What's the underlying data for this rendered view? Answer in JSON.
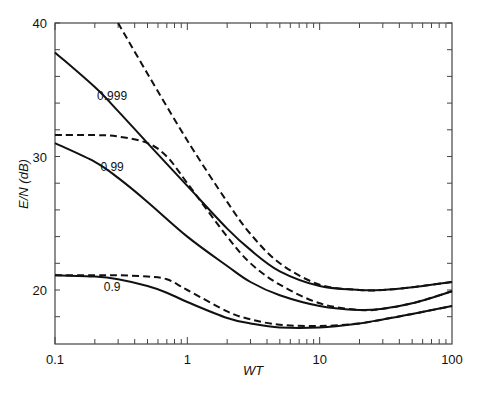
{
  "chart_data": {
    "type": "line",
    "title": "",
    "xlabel": "WT",
    "ylabel": "E/N (dB)",
    "xscale": "log",
    "xlim": [
      0.1,
      100
    ],
    "ylim": [
      16,
      40
    ],
    "grid": false,
    "legend": "none (curves labeled inline)",
    "x_ticks": [
      "0.1",
      "1",
      "10",
      "100"
    ],
    "y_ticks": [
      "20",
      "30",
      "40"
    ],
    "series": [
      {
        "name": "0.999",
        "style": "solid",
        "x": [
          0.1,
          0.2,
          0.3,
          0.5,
          1,
          2,
          3,
          5,
          10,
          20,
          30,
          50,
          100
        ],
        "y": [
          37.8,
          35.2,
          33.4,
          31.0,
          27.8,
          24.6,
          23.0,
          21.4,
          20.3,
          20.0,
          20.0,
          20.2,
          20.6
        ]
      },
      {
        "name": "0.999 (dashed)",
        "style": "dashed",
        "x": [
          0.3,
          0.5,
          1,
          2,
          3,
          5,
          10,
          20,
          30,
          50,
          100
        ],
        "y": [
          40.0,
          36.2,
          31.2,
          26.6,
          24.2,
          22.0,
          20.4,
          20.0,
          20.0,
          20.2,
          20.6
        ]
      },
      {
        "name": "0.99",
        "style": "solid",
        "x": [
          0.1,
          0.2,
          0.3,
          0.5,
          1,
          2,
          3,
          5,
          10,
          20,
          30,
          50,
          100
        ],
        "y": [
          31.0,
          29.6,
          28.4,
          26.6,
          24.0,
          21.8,
          20.6,
          19.6,
          18.8,
          18.5,
          18.6,
          19.0,
          19.9
        ]
      },
      {
        "name": "0.99 (dashed)",
        "style": "dashed",
        "x": [
          0.1,
          0.2,
          0.3,
          0.5,
          0.7,
          1,
          2,
          3,
          5,
          10,
          20,
          30,
          50,
          100
        ],
        "y": [
          31.6,
          31.6,
          31.5,
          31.0,
          30.0,
          28.0,
          24.0,
          22.0,
          20.4,
          19.0,
          18.5,
          18.6,
          19.0,
          19.9
        ]
      },
      {
        "name": "0.9",
        "style": "solid",
        "x": [
          0.1,
          0.2,
          0.3,
          0.5,
          0.7,
          1,
          2,
          3,
          5,
          10,
          20,
          30,
          50,
          100
        ],
        "y": [
          21.1,
          21.0,
          20.8,
          20.3,
          19.8,
          19.1,
          17.9,
          17.5,
          17.2,
          17.2,
          17.5,
          17.8,
          18.2,
          18.8
        ]
      },
      {
        "name": "0.9 (dashed)",
        "style": "dashed",
        "x": [
          0.1,
          0.2,
          0.3,
          0.5,
          0.7,
          1,
          2,
          3,
          5,
          10,
          20,
          30,
          50,
          100
        ],
        "y": [
          21.1,
          21.1,
          21.1,
          21.0,
          20.8,
          20.0,
          18.4,
          17.8,
          17.4,
          17.3,
          17.5,
          17.8,
          18.2,
          18.8
        ]
      }
    ],
    "annotations": [
      {
        "text": "0.999",
        "x": 0.27,
        "y": 34.2
      },
      {
        "text": "0.99",
        "x": 0.27,
        "y": 28.9
      },
      {
        "text": "0.9",
        "x": 0.27,
        "y": 19.9
      }
    ]
  }
}
